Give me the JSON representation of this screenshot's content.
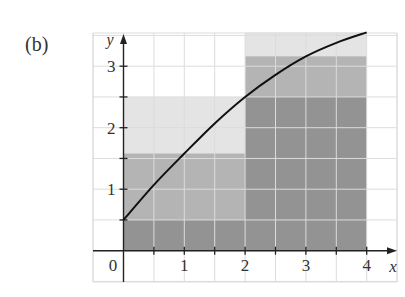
{
  "figure": {
    "part_label": "(b)"
  },
  "chart_data": {
    "type": "area",
    "title": "",
    "xlabel": "x",
    "ylabel": "y",
    "xlim": [
      -1,
      4.5
    ],
    "ylim": [
      -1,
      3.8
    ],
    "grid": true,
    "grid_step": 0.5,
    "x_ticks": [
      0.5,
      1,
      1.5,
      2,
      2.5,
      3,
      3.5,
      4
    ],
    "x_tick_labels": [
      {
        "value": 1,
        "label": "1"
      },
      {
        "value": 2,
        "label": "2"
      },
      {
        "value": 3,
        "label": "3"
      },
      {
        "value": 4,
        "label": "4"
      }
    ],
    "y_ticks": [
      0.5,
      1,
      1.5,
      2,
      2.5,
      3
    ],
    "y_tick_labels": [
      {
        "value": 1,
        "label": "1"
      },
      {
        "value": 2,
        "label": "2"
      },
      {
        "value": 3,
        "label": "3"
      }
    ],
    "origin_label": "0",
    "curve": {
      "x": [
        0,
        0.5,
        1,
        1.5,
        2,
        2.5,
        3,
        3.5,
        4
      ],
      "y": [
        0.5,
        1.07,
        1.58,
        2.07,
        2.5,
        2.86,
        3.16,
        3.38,
        3.55
      ]
    },
    "rectangles": [
      {
        "x0": 0,
        "x1": 2,
        "height": 2.5,
        "shade": "light"
      },
      {
        "x0": 0,
        "x1": 2,
        "height": 1.58,
        "shade": "mid"
      },
      {
        "x0": 0,
        "x1": 2,
        "height": 0.5,
        "shade": "dark"
      },
      {
        "x0": 2,
        "x1": 4,
        "height": 3.55,
        "shade": "light"
      },
      {
        "x0": 2,
        "x1": 4,
        "height": 3.16,
        "shade": "mid"
      },
      {
        "x0": 2,
        "x1": 4,
        "height": 2.5,
        "shade": "dark"
      }
    ],
    "colors": {
      "light": "#e4e4e4",
      "mid": "#b4b4b4",
      "dark": "#939393",
      "curve": "#111111",
      "grid": "#dcdcdc"
    }
  }
}
